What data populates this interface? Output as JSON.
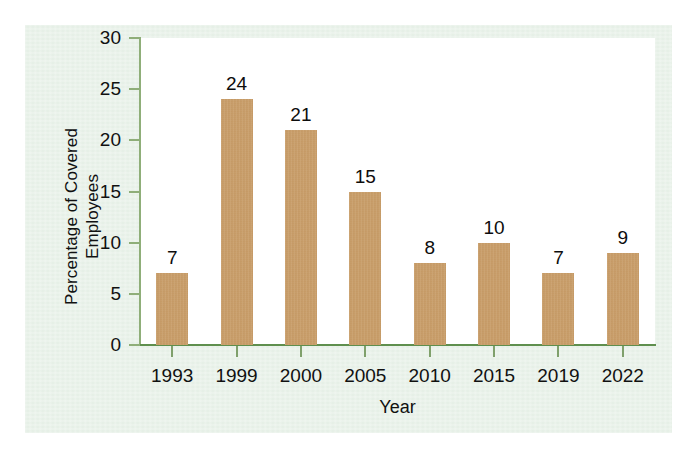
{
  "chart_data": {
    "type": "bar",
    "title": "",
    "subtitle": "",
    "xlabel": "Year",
    "ylabel": "Percentage of Covered Employees",
    "ylabel_lines": [
      "Percentage of Covered",
      "Employees"
    ],
    "categories": [
      "1993",
      "1999",
      "2000",
      "2005",
      "2010",
      "2015",
      "2019",
      "2022"
    ],
    "values": [
      7,
      24,
      21,
      15,
      8,
      10,
      7,
      9
    ],
    "data_labels": [
      "7",
      "24",
      "21",
      "15",
      "8",
      "10",
      "7",
      "9"
    ],
    "ylim": [
      0,
      30
    ],
    "y_ticks": [
      0,
      5,
      10,
      15,
      20,
      25,
      30
    ],
    "y_tick_labels": [
      "0",
      "5",
      "10",
      "15",
      "20",
      "25",
      "30"
    ],
    "grid": false,
    "legend": false,
    "legend_position": "none",
    "annotations": []
  },
  "style": {
    "bar_color": "#c89a62",
    "panel_background": "#e3eee4",
    "plot_background": "#ffffff",
    "axis_color": "#5f8f4e",
    "y_axis_color": "#8fae79",
    "text_color": "#111111",
    "page_background": "#ffffff"
  }
}
